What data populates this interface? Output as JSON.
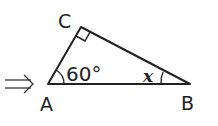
{
  "diagram": {
    "arrow_symbol": "⇒",
    "vertices": {
      "A": {
        "label": "A",
        "x": 48,
        "y": 84
      },
      "B": {
        "label": "B",
        "x": 190,
        "y": 84
      },
      "C": {
        "label": "C",
        "x": 81,
        "y": 27
      }
    },
    "angle_A_label": "60°",
    "angle_B_label": "x",
    "right_angle_at": "C",
    "stroke_color": "#222222"
  }
}
